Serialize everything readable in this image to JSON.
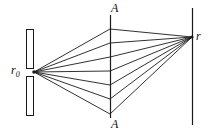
{
  "figure": {
    "kind": "optics-ray-diagram",
    "width": 214,
    "height": 132,
    "background_color": "#ffffff",
    "stroke_color": "#1a1a1a",
    "labels": {
      "aperture_top": "A",
      "aperture_bottom": "A",
      "source": "r",
      "source_subscript": "0",
      "observation": "r"
    },
    "barrier": {
      "name": "slit-barrier",
      "x_left": 26,
      "x_right": 33,
      "y_top": 29,
      "y_bottom": 116,
      "gap_y_center": 72,
      "gap_height": 7
    },
    "aperture_plane": {
      "name": "aperture-plane-A-A",
      "x": 110,
      "y_top": 15,
      "y_bottom": 118
    },
    "observation_plane": {
      "name": "observation-plane",
      "x": 192,
      "y_top": 8,
      "y_bottom": 125
    },
    "source_point": {
      "x": 34,
      "y": 72
    },
    "convergence_point": {
      "x": 192,
      "y": 37
    },
    "rays": [
      {
        "id": "ray-1",
        "aperture_y": 29
      },
      {
        "id": "ray-2",
        "aperture_y": 43
      },
      {
        "id": "ray-3",
        "aperture_y": 57
      },
      {
        "id": "ray-4",
        "aperture_y": 71
      },
      {
        "id": "ray-5",
        "aperture_y": 85
      },
      {
        "id": "ray-6",
        "aperture_y": 99
      },
      {
        "id": "ray-7",
        "aperture_y": 114
      }
    ]
  }
}
